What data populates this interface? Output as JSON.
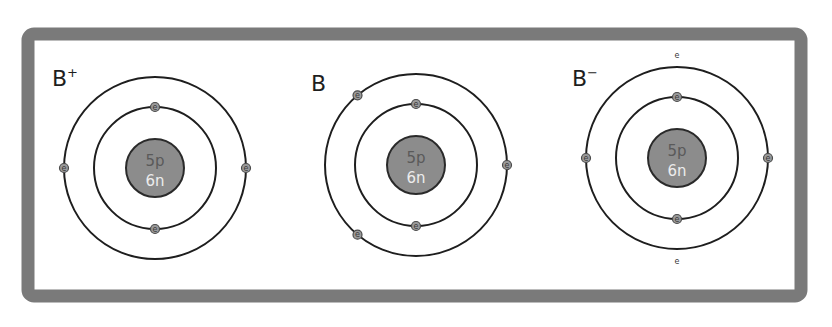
{
  "diagram": {
    "frame_color": "#7a7a7a",
    "nucleus_color": "#8c8c8c",
    "electron_color": "#9a9a9a",
    "electron_symbol": "e",
    "atoms": [
      {
        "id": "b-plus",
        "symbol": "B",
        "charge": "+",
        "nucleus": {
          "protons": "5p",
          "neutrons": "6n"
        },
        "shells": [
          {
            "name": "inner",
            "electron_count": 2,
            "electron_angles_deg": [
              270,
              90
            ],
            "placement": "on-shell"
          },
          {
            "name": "outer",
            "electron_count": 2,
            "electron_angles_deg": [
              180,
              0
            ],
            "placement": "on-shell"
          }
        ],
        "total_electrons": 4
      },
      {
        "id": "b-neutral",
        "symbol": "B",
        "charge": "",
        "nucleus": {
          "protons": "5p",
          "neutrons": "6n"
        },
        "shells": [
          {
            "name": "inner",
            "electron_count": 2,
            "electron_angles_deg": [
              270,
              90
            ],
            "placement": "on-shell"
          },
          {
            "name": "outer",
            "electron_count": 3,
            "electron_angles_deg": [
              0,
              230,
              130
            ],
            "placement": "on-shell"
          }
        ],
        "total_electrons": 5
      },
      {
        "id": "b-minus",
        "symbol": "B",
        "charge": "−",
        "nucleus": {
          "protons": "5p",
          "neutrons": "6n"
        },
        "shells": [
          {
            "name": "inner",
            "electron_count": 2,
            "electron_angles_deg": [
              270,
              90
            ],
            "placement": "on-shell"
          },
          {
            "name": "outer",
            "electron_count": 2,
            "electron_angles_deg": [
              180,
              0
            ],
            "placement": "on-shell"
          },
          {
            "name": "outer-extra",
            "electron_count": 2,
            "electron_angles_deg": [
              270,
              90
            ],
            "placement": "outside-shell"
          }
        ],
        "total_electrons": 6
      }
    ]
  }
}
